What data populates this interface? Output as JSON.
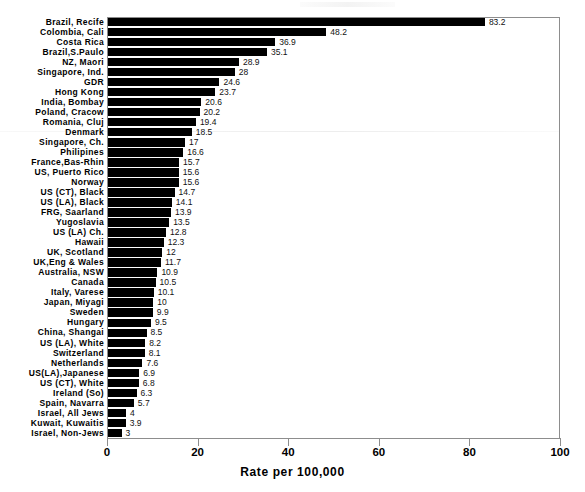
{
  "chart_data": {
    "type": "bar",
    "orientation": "horizontal",
    "title": "",
    "xlabel": "Rate per 100,000",
    "ylabel": "",
    "xlim": [
      0,
      100
    ],
    "xticks": [
      0,
      20,
      40,
      60,
      80,
      100
    ],
    "grid": false,
    "legend": null,
    "bar_color": "#000000",
    "categories": [
      "Brazil, Recife",
      "Colombia, Cali",
      "Costa Rica",
      "Brazil,S.Paulo",
      "NZ, Maori",
      "Singapore, Ind.",
      "GDR",
      "Hong Kong",
      "India, Bombay",
      "Poland, Cracow",
      "Romania, Cluj",
      "Denmark",
      "Singapore, Ch.",
      "Philipines",
      "France,Bas-Rhin",
      "US, Puerto Rico",
      "Norway",
      "US (CT), Black",
      "US (LA), Black",
      "FRG, Saarland",
      "Yugoslavia",
      "US (LA) Ch.",
      "Hawaii",
      "UK, Scotland",
      "UK,Eng & Wales",
      "Australia, NSW",
      "Canada",
      "Italy, Varese",
      "Japan, Miyagi",
      "Sweden",
      "Hungary",
      "China, Shangai",
      "US (LA), White",
      "Switzerland",
      "Netherlands",
      "US(LA),Japanese",
      "US (CT), White",
      "Ireland (So)",
      "Spain, Navarra",
      "Israel, All Jews",
      "Kuwait, Kuwaitis",
      "Israel, Non-Jews"
    ],
    "values": [
      83.2,
      48.2,
      36.9,
      35.1,
      28.9,
      28,
      24.6,
      23.7,
      20.6,
      20.2,
      19.4,
      18.5,
      17,
      16.6,
      15.7,
      15.6,
      15.6,
      14.7,
      14.1,
      13.9,
      13.5,
      12.8,
      12.3,
      12,
      11.7,
      10.9,
      10.5,
      10.1,
      10,
      9.9,
      9.5,
      8.5,
      8.2,
      8.1,
      7.6,
      6.9,
      6.8,
      6.3,
      5.7,
      4,
      3.9,
      3
    ],
    "value_labels": [
      "83.2",
      "48.2",
      "36.9",
      "35.1",
      "28.9",
      "28",
      "24.6",
      "23.7",
      "20.6",
      "20.2",
      "19.4",
      "18.5",
      "17",
      "16.6",
      "15.7",
      "15.6",
      "15.6",
      "14.7",
      "14.1",
      "13.9",
      "13.5",
      "12.8",
      "12.3",
      "12",
      "11.7",
      "10.9",
      "10.5",
      "10.1",
      "10",
      "9.9",
      "9.5",
      "8.5",
      "8.2",
      "8.1",
      "7.6",
      "6.9",
      "6.8",
      "6.3",
      "5.7",
      "4",
      "3.9",
      "3"
    ]
  }
}
